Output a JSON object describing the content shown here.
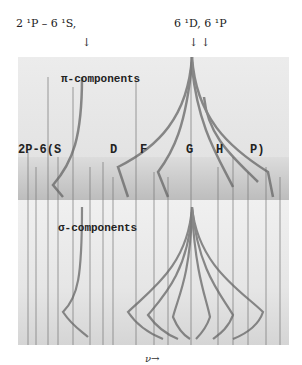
{
  "figure": {
    "top_labels": {
      "left": "2 ¹P  –  6 ¹S,",
      "right": "6 ¹D, 6 ¹P"
    },
    "arrows": [
      "↓",
      "↓",
      "↓"
    ],
    "panels": {
      "pi": "π-components",
      "sigma": "σ-components"
    },
    "series_labels": [
      "2P-6(S",
      "D",
      "F",
      "G",
      "H",
      "P)"
    ],
    "x_axis_label": "ν→"
  }
}
